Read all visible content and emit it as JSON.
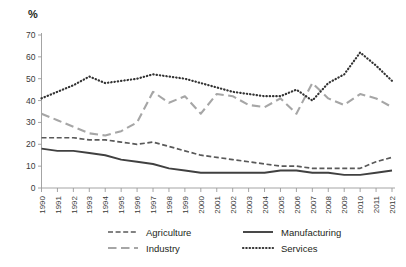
{
  "chart_data": {
    "type": "line",
    "title": "",
    "subtitle": "",
    "xlabel": "",
    "ylabel": "%",
    "ylim": [
      0,
      70
    ],
    "ytick_step": 10,
    "yticks": [
      0,
      10,
      20,
      30,
      40,
      50,
      60,
      70
    ],
    "grid": false,
    "legend_position": "bottom",
    "x": [
      "1990",
      "1991",
      "1992",
      "1993",
      "1994",
      "1995",
      "1996",
      "1997",
      "1998",
      "1999",
      "2000",
      "2001",
      "2002",
      "2003",
      "2004",
      "2005",
      "2006",
      "2007",
      "2008",
      "2009",
      "2010",
      "2011",
      "2012"
    ],
    "categories": [
      "1990",
      "1991",
      "1992",
      "1993",
      "1994",
      "1995",
      "1996",
      "1997",
      "1998",
      "1999",
      "2000",
      "2001",
      "2002",
      "2003",
      "2004",
      "2005",
      "2006",
      "2007",
      "2008",
      "2009",
      "2010",
      "2011",
      "2012"
    ],
    "series": [
      {
        "name": "Agriculture",
        "style": "dashed",
        "color": "#595959",
        "values": [
          23,
          23,
          23,
          22,
          22,
          21,
          20,
          21,
          19,
          17,
          15,
          14,
          13,
          12,
          11,
          10,
          10,
          9,
          9,
          9,
          9,
          12,
          14
        ]
      },
      {
        "name": "Manufacturing",
        "style": "solid",
        "color": "#404040",
        "values": [
          18,
          17,
          17,
          16,
          15,
          13,
          12,
          11,
          9,
          8,
          7,
          7,
          7,
          7,
          7,
          8,
          8,
          7,
          7,
          6,
          6,
          7,
          8
        ]
      },
      {
        "name": "Industry",
        "style": "long-dash",
        "color": "#a6a6a6",
        "values": [
          34,
          31,
          28,
          25,
          24,
          26,
          30,
          44,
          39,
          42,
          34,
          43,
          42,
          38,
          37,
          41,
          34,
          48,
          41,
          38,
          43,
          41,
          37
        ]
      },
      {
        "name": "Services",
        "style": "dotted",
        "color": "#333333",
        "values": [
          41,
          44,
          47,
          51,
          48,
          49,
          50,
          52,
          51,
          50,
          48,
          46,
          44,
          43,
          42,
          42,
          45,
          40,
          48,
          52,
          62,
          56,
          49
        ]
      }
    ],
    "legend": [
      {
        "label": "Agriculture",
        "style": "dashed",
        "color": "#595959"
      },
      {
        "label": "Manufacturing",
        "style": "solid",
        "color": "#404040"
      },
      {
        "label": "Industry",
        "style": "long-dash",
        "color": "#a6a6a6"
      },
      {
        "label": "Services",
        "style": "dotted",
        "color": "#333333"
      }
    ],
    "axis_color": "#9a9a9a"
  }
}
